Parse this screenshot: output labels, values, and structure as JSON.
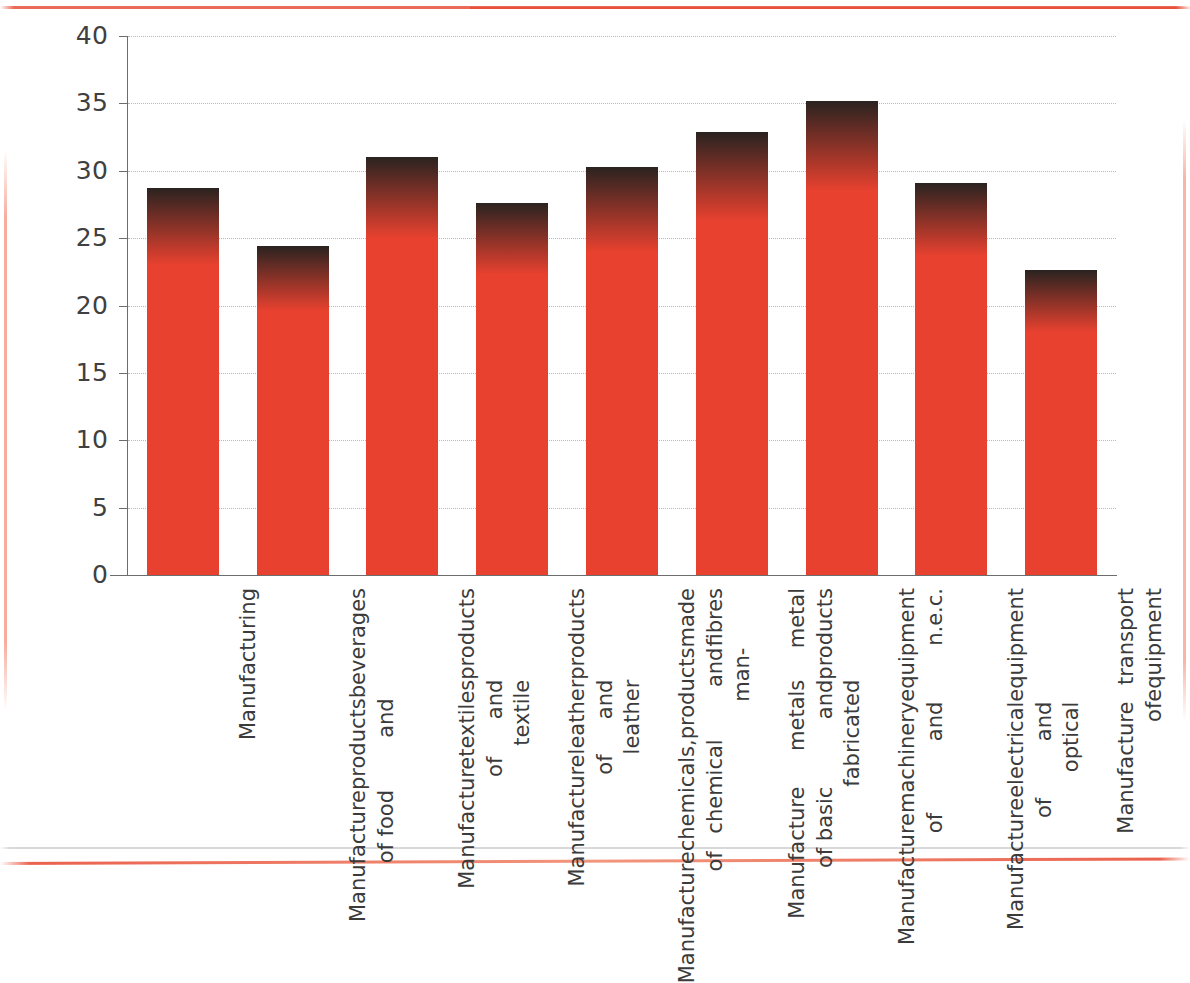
{
  "chart_data": {
    "type": "bar",
    "title": "",
    "subtitle": "",
    "xlabel": "",
    "ylabel": "",
    "ylim": [
      0,
      40
    ],
    "ytick_step": 5,
    "yticks": [
      "40",
      "35",
      "30",
      "25",
      "20",
      "15",
      "10",
      "5",
      "0"
    ],
    "grid": true,
    "legend": "none",
    "orientation": "vertical",
    "bar_style": "vertical-gradient",
    "categories": [
      "Manufacturing",
      "Manufacture of food products and beverages",
      "Manufacture of textiles and textile products",
      "Manufacture of leather and leather products",
      "Manufacture of chemicals, chemical products and man-made fibres",
      "Manufacture of basic metals and fabricated metal products",
      "Manufacture of machinery and equipment n.e.c.",
      "Manufacture of electrical and optical equipment",
      "Manufacture of transport equipment"
    ],
    "category_lines": [
      [
        "Manufacturing"
      ],
      [
        "Manufacture of food",
        "products and",
        "beverages"
      ],
      [
        "Manufacture of",
        "textiles and textile",
        "products"
      ],
      [
        "Manufacture of",
        "leather and leather",
        "products"
      ],
      [
        "Manufacture of",
        "chemicals, chemical",
        "products and man-",
        "made fibres"
      ],
      [
        "Manufacture of basic",
        "metals and fabricated",
        "metal products"
      ],
      [
        "Manufacture of",
        "machinery and",
        "equipment n.e.c."
      ],
      [
        "Manufacture of",
        "electrical and optical",
        "equipment"
      ],
      [
        "Manufacture of",
        "transport equipment"
      ]
    ],
    "values": [
      28.7,
      24.4,
      31.0,
      27.6,
      30.3,
      32.9,
      35.2,
      29.1,
      22.6
    ],
    "gradient_start_values": [
      23.0,
      19.6,
      25.0,
      22.3,
      24.0,
      26.3,
      28.5,
      23.7,
      18.0
    ],
    "colors": {
      "bar_bottom": "#e8412f",
      "bar_top": "#2a2320",
      "gridline": "#b9b9b9",
      "axis": "#6d6d6d",
      "tick_label": "#404040",
      "category_label": "#3b3b3b",
      "background": "#ffffff",
      "scan_artifact": "#e8503a"
    }
  }
}
